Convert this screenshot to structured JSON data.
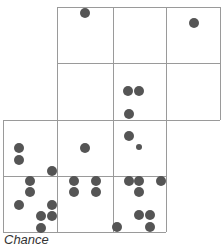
{
  "diagram": {
    "caption": "Chance",
    "colors": {
      "grid_line": "#9a9a9a",
      "dot": "#555555",
      "background": "#ffffff"
    },
    "grid_lines": {
      "vertical": [
        {
          "x": 3,
          "y1": 120,
          "y2": 232
        },
        {
          "x": 57,
          "y1": 7,
          "y2": 232
        },
        {
          "x": 113,
          "y1": 7,
          "y2": 232
        },
        {
          "x": 166,
          "y1": 7,
          "y2": 232
        },
        {
          "x": 220,
          "y1": 7,
          "y2": 120
        }
      ],
      "horizontal": [
        {
          "y": 7,
          "x1": 57,
          "x2": 220
        },
        {
          "y": 63,
          "x1": 57,
          "x2": 220
        },
        {
          "y": 120,
          "x1": 3,
          "x2": 220
        },
        {
          "y": 176,
          "x1": 3,
          "x2": 166
        },
        {
          "y": 232,
          "x1": 3,
          "x2": 166
        }
      ]
    },
    "dots": [
      {
        "x": 85,
        "y": 13,
        "r": 5
      },
      {
        "x": 194,
        "y": 23,
        "r": 5
      },
      {
        "x": 128,
        "y": 91,
        "r": 5
      },
      {
        "x": 139,
        "y": 91,
        "r": 5
      },
      {
        "x": 129,
        "y": 114,
        "r": 5
      },
      {
        "x": 19,
        "y": 148,
        "r": 5
      },
      {
        "x": 19,
        "y": 160,
        "r": 5
      },
      {
        "x": 52,
        "y": 171,
        "r": 5
      },
      {
        "x": 85,
        "y": 148,
        "r": 5
      },
      {
        "x": 129,
        "y": 136,
        "r": 5
      },
      {
        "x": 139,
        "y": 147,
        "r": 3
      },
      {
        "x": 30,
        "y": 181,
        "r": 5
      },
      {
        "x": 30,
        "y": 192,
        "r": 5
      },
      {
        "x": 19,
        "y": 205,
        "r": 5
      },
      {
        "x": 52,
        "y": 205,
        "r": 5
      },
      {
        "x": 41,
        "y": 216,
        "r": 5
      },
      {
        "x": 52,
        "y": 216,
        "r": 5
      },
      {
        "x": 41,
        "y": 228,
        "r": 5
      },
      {
        "x": 74,
        "y": 181,
        "r": 5
      },
      {
        "x": 96,
        "y": 181,
        "r": 5
      },
      {
        "x": 74,
        "y": 192,
        "r": 5
      },
      {
        "x": 96,
        "y": 192,
        "r": 5
      },
      {
        "x": 129,
        "y": 181,
        "r": 5
      },
      {
        "x": 139,
        "y": 181,
        "r": 5
      },
      {
        "x": 161,
        "y": 181,
        "r": 5
      },
      {
        "x": 139,
        "y": 192,
        "r": 5
      },
      {
        "x": 139,
        "y": 215,
        "r": 5
      },
      {
        "x": 150,
        "y": 215,
        "r": 5
      },
      {
        "x": 117,
        "y": 227,
        "r": 5
      },
      {
        "x": 150,
        "y": 227,
        "r": 5
      }
    ]
  }
}
